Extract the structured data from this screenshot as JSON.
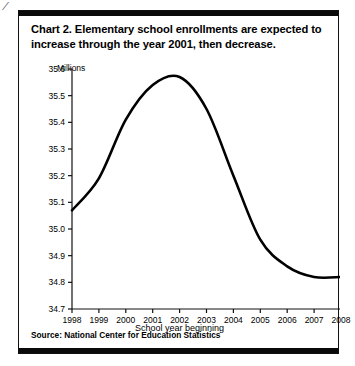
{
  "title": {
    "number": "Chart 2.",
    "text": "Elementary school enrollments are expected to increase through the year 2001, then decrease."
  },
  "source": "Source: National Center for Education Statistics",
  "corner_mark": "⁄",
  "chart_data": {
    "type": "line",
    "xlabel": "School year beginning",
    "ylabel": "Millions",
    "unit_label": "Millions",
    "grid": false,
    "legend": "none",
    "xlim": [
      1998,
      2008
    ],
    "ylim": [
      34.7,
      35.6
    ],
    "categories": [
      "1998",
      "1999",
      "2000",
      "2001",
      "2002",
      "2003",
      "2004",
      "2005",
      "2006",
      "2007",
      "2008"
    ],
    "x": [
      1998,
      1999,
      2000,
      2001,
      2002,
      2003,
      2004,
      2005,
      2006,
      2007,
      2008
    ],
    "values": [
      35.07,
      35.19,
      35.41,
      35.54,
      35.57,
      35.45,
      35.2,
      34.96,
      34.86,
      34.82,
      34.82
    ],
    "xticks": [
      "1998",
      "1999",
      "2000",
      "2001",
      "2002",
      "2003",
      "2004",
      "2005",
      "2006",
      "2007",
      "2008"
    ],
    "yticks": [
      "34.7",
      "34.8",
      "34.9",
      "35.0",
      "35.1",
      "35.2",
      "35.3",
      "35.4",
      "35.5",
      "35.6"
    ],
    "ytick_values": [
      34.7,
      34.8,
      34.9,
      35.0,
      35.1,
      35.2,
      35.3,
      35.4,
      35.5,
      35.6
    ],
    "line_color": "#000000",
    "line_width": 2.6,
    "annotations": []
  }
}
